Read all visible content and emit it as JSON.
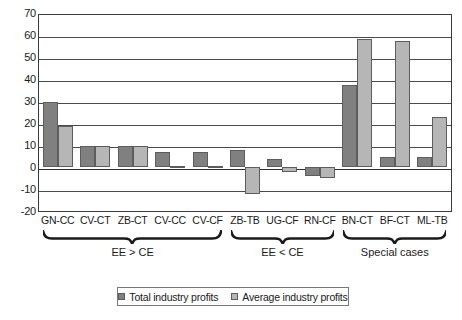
{
  "chart_data": {
    "type": "bar",
    "title": "",
    "subtitle": "",
    "xlabel": "",
    "ylabel": "",
    "ylim": [
      -20,
      70
    ],
    "ytick_labels": [
      "70",
      "60",
      "50",
      "40",
      "30",
      "20",
      "10",
      "0",
      "-10",
      "-20"
    ],
    "ytick_values": [
      70,
      60,
      50,
      40,
      30,
      20,
      10,
      0,
      -10,
      -20
    ],
    "grid": true,
    "legend_position": "bottom",
    "categories": [
      "GN-CC",
      "CV-CT",
      "ZB-CT",
      "CV-CC",
      "CV-CF",
      "ZB-TB",
      "UG-CF",
      "RN-CF",
      "BN-CT",
      "BF-CT",
      "ML-TB"
    ],
    "series": [
      {
        "name": "Total industry profits",
        "color": "#808080",
        "values": [
          30,
          10,
          10,
          7,
          7,
          8,
          4,
          -4,
          38,
          5,
          5
        ]
      },
      {
        "name": "Average industry profits",
        "color": "#b6b6b6",
        "values": [
          19,
          10,
          10,
          0.5,
          0.5,
          -12,
          -2,
          -5,
          59,
          58,
          23
        ]
      }
    ],
    "groups": [
      {
        "label": "EE > CE",
        "start_index": 0,
        "end_index": 4
      },
      {
        "label": "EE < CE",
        "start_index": 5,
        "end_index": 7
      },
      {
        "label": "Special cases",
        "start_index": 8,
        "end_index": 10
      }
    ]
  },
  "legend": {
    "items": [
      {
        "label": "Total industry profits",
        "key": "total"
      },
      {
        "label": "Average industry profits",
        "key": "average"
      }
    ]
  },
  "colors": {
    "total_series": "#808080",
    "average_series": "#b6b6b6",
    "axis": "#3a3a3a",
    "grid": "#4a4a4a",
    "background": "#ffffff"
  }
}
